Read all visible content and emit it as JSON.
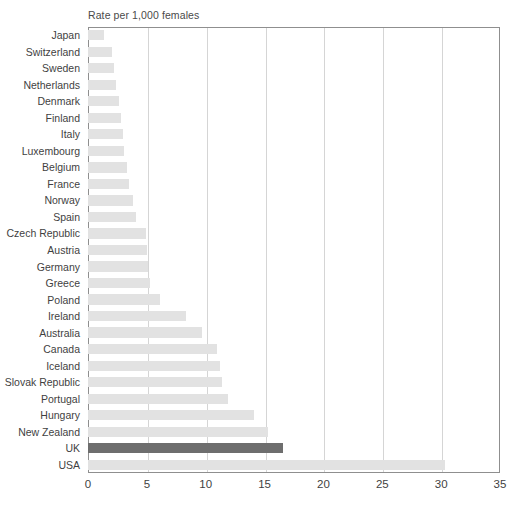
{
  "chart_data": {
    "type": "bar",
    "orientation": "horizontal",
    "title": "Rate per 1,000 females",
    "xlabel": "",
    "ylabel": "",
    "xlim": [
      0,
      35
    ],
    "xticks": [
      0,
      5,
      10,
      15,
      20,
      25,
      30,
      35
    ],
    "grid": true,
    "legend": false,
    "highlight_category": "UK",
    "colors": {
      "bar": "#e2e2e2",
      "bar_highlight": "#6e6e6e",
      "gridline": "#d5d5d5",
      "frame": "#8f8f8f",
      "text": "#3f3f3f"
    },
    "categories": [
      "Japan",
      "Switzerland",
      "Sweden",
      "Netherlands",
      "Denmark",
      "Finland",
      "Italy",
      "Luxembourg",
      "Belgium",
      "France",
      "Norway",
      "Spain",
      "Czech Republic",
      "Austria",
      "Germany",
      "Greece",
      "Poland",
      "Ireland",
      "Australia",
      "Canada",
      "Iceland",
      "Slovak Republic",
      "Portugal",
      "Hungary",
      "New Zealand",
      "UK",
      "USA"
    ],
    "values": [
      1.4,
      2.0,
      2.2,
      2.4,
      2.6,
      2.8,
      3.0,
      3.1,
      3.3,
      3.5,
      3.8,
      4.1,
      4.9,
      5.0,
      5.1,
      5.3,
      6.1,
      8.3,
      9.7,
      11.0,
      11.2,
      11.4,
      11.9,
      14.1,
      15.3,
      16.6,
      30.3
    ]
  },
  "xticklabels": [
    "0",
    "5",
    "10",
    "15",
    "20",
    "25",
    "30",
    "35"
  ]
}
